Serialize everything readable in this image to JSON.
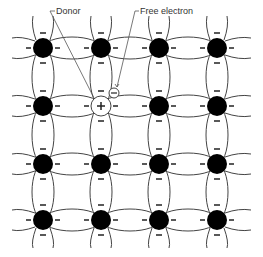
{
  "diagram": {
    "type": "crystal-lattice",
    "labels": {
      "donor": "Donor",
      "free_electron": "Free electron"
    },
    "grid": {
      "columns": [
        43,
        101,
        159,
        217
      ],
      "rows": [
        48,
        106,
        164,
        220
      ],
      "atom_radius": 10
    },
    "donor_position": {
      "col": 1,
      "row": 1,
      "symbol": "+"
    },
    "free_electron_symbol": "−",
    "bond_electron_symbol": "−",
    "colors": {
      "atom": "#000000",
      "lines": "#444444",
      "background": "#ffffff"
    }
  }
}
